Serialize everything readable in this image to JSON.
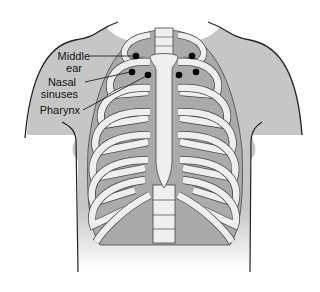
{
  "figure": {
    "labels": [
      {
        "id": "middle-ear",
        "line1": "Middle",
        "line2": "ear"
      },
      {
        "id": "nasal-sinuses",
        "line1": "Nasal",
        "line2": "sinuses"
      },
      {
        "id": "pharynx",
        "line1": "Pharynx",
        "line2": ""
      }
    ],
    "points": [
      {
        "x": 136,
        "y": 56
      },
      {
        "x": 192,
        "y": 56
      },
      {
        "x": 132,
        "y": 72
      },
      {
        "x": 196,
        "y": 72
      },
      {
        "x": 148,
        "y": 75
      },
      {
        "x": 179,
        "y": 75
      }
    ],
    "colors": {
      "body": "#c8c8c8",
      "bone": "#efefef",
      "outline": "#333333",
      "gap": "#a9a9a9",
      "dot": "#000000"
    }
  }
}
